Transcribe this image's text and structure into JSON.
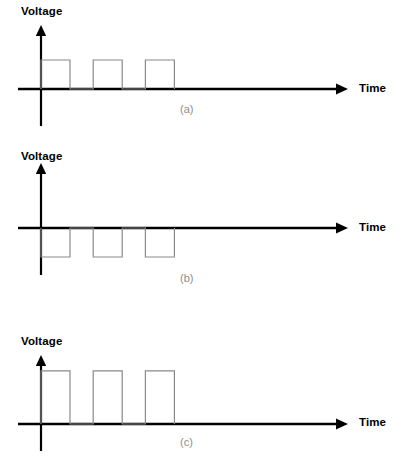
{
  "chart_data": [
    {
      "type": "line",
      "id": "a",
      "title": "(a)",
      "xlabel": "Time",
      "ylabel": "Voltage",
      "grid": false,
      "legend": "none",
      "description": "Unipolar positive square-wave pulse train: three positive rectangular pulses of equal amplitude returning to zero between pulses.",
      "amplitude": 1,
      "baseline": 0,
      "ylim": [
        -0.2,
        1.6
      ],
      "xlim": [
        0,
        10
      ],
      "pulses": [
        {
          "start": 0.0,
          "end": 1.0,
          "level": 1
        },
        {
          "start": 1.8,
          "end": 2.8,
          "level": 1
        },
        {
          "start": 3.6,
          "end": 4.6,
          "level": 1
        }
      ],
      "x": [
        0.0,
        0.0,
        1.0,
        1.0,
        1.8,
        1.8,
        2.8,
        2.8,
        3.6,
        3.6,
        4.6,
        4.6,
        10.0
      ],
      "y": [
        0,
        1,
        1,
        0,
        0,
        1,
        1,
        0,
        0,
        1,
        1,
        0,
        0
      ]
    },
    {
      "type": "line",
      "id": "b",
      "title": "(b)",
      "xlabel": "Time",
      "ylabel": "Voltage",
      "grid": false,
      "legend": "none",
      "description": "Unipolar negative square-wave pulse train: three negative rectangular pulses of equal amplitude, the inverse of (a).",
      "amplitude": -1,
      "baseline": 0,
      "ylim": [
        -1.6,
        0.9
      ],
      "xlim": [
        0,
        10
      ],
      "pulses": [
        {
          "start": 0.0,
          "end": 1.0,
          "level": -1
        },
        {
          "start": 1.8,
          "end": 2.8,
          "level": -1
        },
        {
          "start": 3.6,
          "end": 4.6,
          "level": -1
        }
      ],
      "x": [
        0.0,
        0.0,
        1.0,
        1.0,
        1.8,
        1.8,
        2.8,
        2.8,
        3.6,
        3.6,
        4.6,
        4.6,
        10.0
      ],
      "y": [
        0,
        -1,
        -1,
        0,
        0,
        -1,
        -1,
        0,
        0,
        -1,
        -1,
        0,
        0
      ]
    },
    {
      "type": "line",
      "id": "c",
      "title": "(c)",
      "xlabel": "Time",
      "ylabel": "Voltage",
      "grid": false,
      "legend": "none",
      "description": "Unipolar positive square-wave pulse train with larger amplitude than (a): three tall positive rectangular pulses.",
      "amplitude": 1.83,
      "baseline": 0,
      "ylim": [
        -0.2,
        2.3
      ],
      "xlim": [
        0,
        10
      ],
      "pulses": [
        {
          "start": 0.0,
          "end": 1.0,
          "level": 1.83
        },
        {
          "start": 1.8,
          "end": 2.8,
          "level": 1.83
        },
        {
          "start": 3.6,
          "end": 4.6,
          "level": 1.83
        }
      ],
      "x": [
        0.0,
        0.0,
        1.0,
        1.0,
        1.8,
        1.8,
        2.8,
        2.8,
        3.6,
        3.6,
        4.6,
        4.6,
        10.0
      ],
      "y": [
        0,
        1.83,
        1.83,
        0,
        0,
        1.83,
        1.83,
        0,
        0,
        1.83,
        1.83,
        0,
        0
      ]
    }
  ],
  "figures": [
    {
      "id": "a",
      "caption": "(a)",
      "y_axis_label": "Voltage",
      "x_axis_label": "Time"
    },
    {
      "id": "b",
      "caption": "(b)",
      "y_axis_label": "Voltage",
      "x_axis_label": "Time"
    },
    {
      "id": "c",
      "caption": "(c)",
      "y_axis_label": "Voltage",
      "x_axis_label": "Time"
    }
  ],
  "colors": {
    "axis": "#000000",
    "waveform": "#8a8a8a",
    "caption": "#8d8d8d",
    "label": "#000000",
    "background": "#ffffff"
  }
}
